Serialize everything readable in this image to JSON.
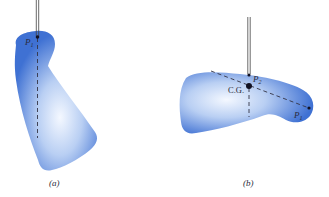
{
  "figure": {
    "panels": [
      {
        "id": "a",
        "caption": "(a)",
        "points": [
          {
            "label": "P",
            "subscript": "1"
          }
        ]
      },
      {
        "id": "b",
        "caption": "(b)",
        "points": [
          {
            "label": "P",
            "subscript": "2"
          },
          {
            "label": "C.G."
          },
          {
            "label": "P",
            "subscript": "1"
          }
        ]
      }
    ],
    "colors": {
      "body_edge": "#3d6fd1",
      "body_center": "#f2f7ff",
      "line": "#333344",
      "dot": "#111122"
    }
  }
}
